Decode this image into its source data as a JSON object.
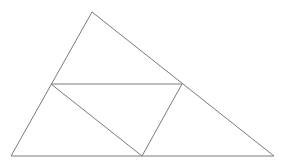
{
  "diagram": {
    "type": "geometry",
    "stroke_color": "#7a7a7a",
    "background": "#ffffff",
    "points": {
      "A": [
        92,
        12
      ],
      "B": [
        11,
        156
      ],
      "C": [
        274,
        156
      ],
      "D": [
        51,
        84
      ],
      "E": [
        182,
        84
      ],
      "F": [
        142,
        156
      ]
    },
    "segments": [
      {
        "from": "A",
        "to": "B"
      },
      {
        "from": "A",
        "to": "C"
      },
      {
        "from": "B",
        "to": "C"
      },
      {
        "from": "D",
        "to": "E"
      },
      {
        "from": "D",
        "to": "F"
      },
      {
        "from": "E",
        "to": "F"
      }
    ]
  }
}
